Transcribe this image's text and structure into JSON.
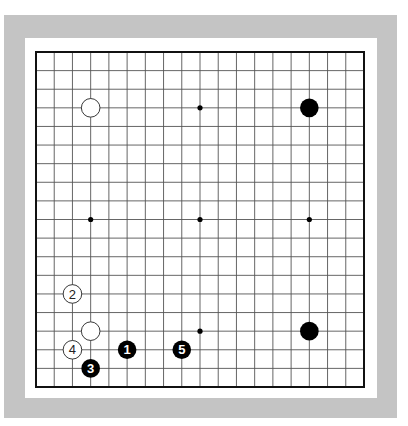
{
  "board": {
    "size": 19,
    "grid_origin": {
      "x": 36,
      "y": 52
    },
    "grid_end": {
      "x": 364,
      "y": 387
    },
    "colors": {
      "frame": "#c4c4c4",
      "background": "#ffffff",
      "line": "#555555",
      "border": "#111111",
      "black": "#000000",
      "white": "#ffffff"
    },
    "hoshi": [
      {
        "col": 4,
        "row": 4
      },
      {
        "col": 10,
        "row": 4
      },
      {
        "col": 16,
        "row": 4
      },
      {
        "col": 4,
        "row": 10
      },
      {
        "col": 10,
        "row": 10
      },
      {
        "col": 16,
        "row": 10
      },
      {
        "col": 4,
        "row": 16
      },
      {
        "col": 10,
        "row": 16
      },
      {
        "col": 16,
        "row": 16
      }
    ],
    "stones": [
      {
        "color": "white",
        "col": 4,
        "row": 4,
        "label": ""
      },
      {
        "color": "black",
        "col": 16,
        "row": 4,
        "label": ""
      },
      {
        "color": "white",
        "col": 4,
        "row": 16,
        "label": ""
      },
      {
        "color": "black",
        "col": 16,
        "row": 16,
        "label": ""
      },
      {
        "color": "black",
        "col": 6,
        "row": 17,
        "label": "1"
      },
      {
        "color": "white",
        "col": 3,
        "row": 14,
        "label": "2"
      },
      {
        "color": "black",
        "col": 4,
        "row": 18,
        "label": "3"
      },
      {
        "color": "white",
        "col": 3,
        "row": 17,
        "label": "4"
      },
      {
        "color": "black",
        "col": 9,
        "row": 17,
        "label": "5"
      }
    ]
  }
}
